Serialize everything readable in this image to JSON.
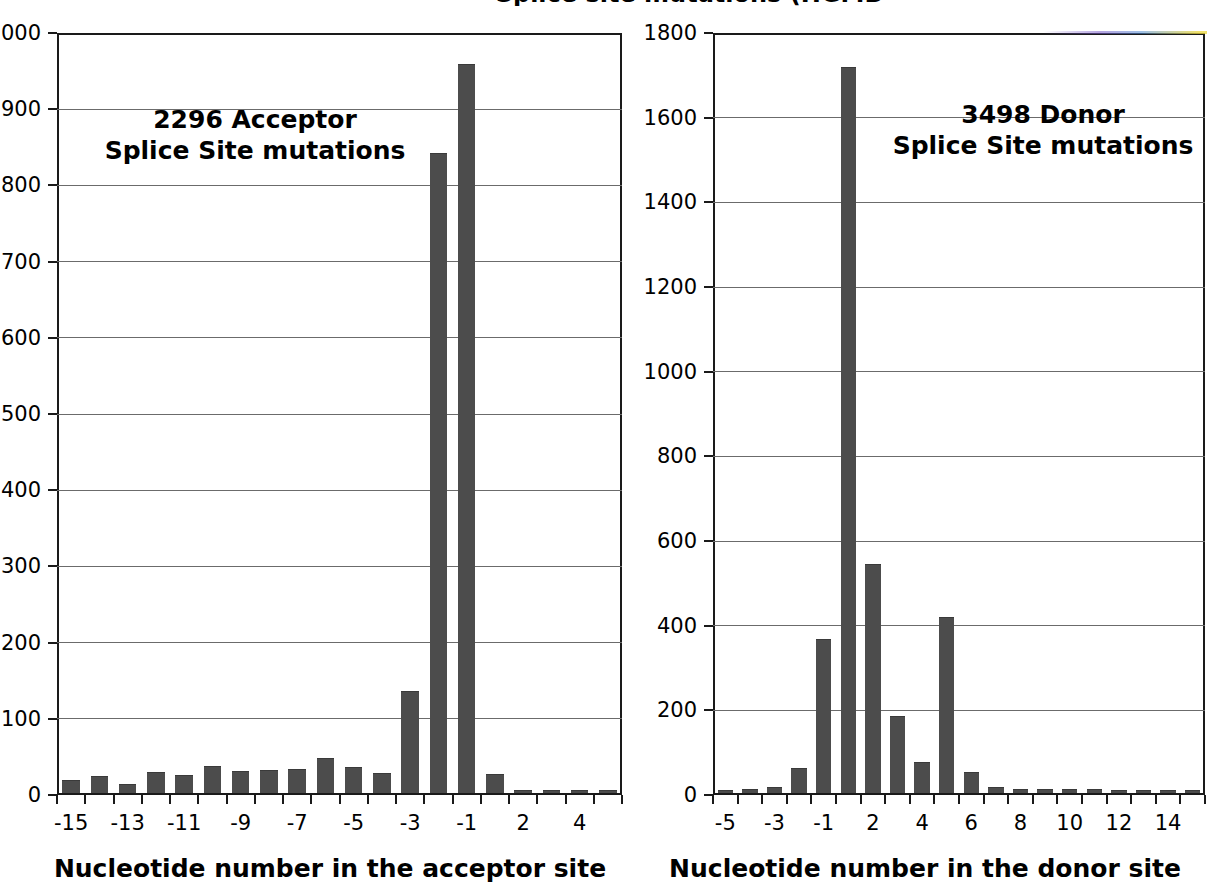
{
  "figure": {
    "background_color": "#ffffff",
    "bar_color": "#4c4c4c",
    "gridline_color": "#6b6b6b",
    "axis_color": "#1a1a1a",
    "cropped_top_title": "Splice site mutations (HGMD 2011.1)"
  },
  "chart_data": [
    {
      "id": "acceptor",
      "type": "bar",
      "title": "2296 Acceptor\nSplice Site mutations",
      "annotation": "2296 Acceptor\nSplice Site mutations",
      "xlabel": "Nucleotide number in the acceptor site",
      "ylabel": "",
      "ylim": [
        0,
        1000
      ],
      "ytick_step": 100,
      "yticks": [
        0,
        100,
        200,
        300,
        400,
        500,
        600,
        700,
        800,
        900,
        1000
      ],
      "ytick_labels": [
        "0",
        "100",
        "200",
        "300",
        "400",
        "500",
        "600",
        "700",
        "800",
        "900",
        "1000"
      ],
      "grid": true,
      "legend": "none",
      "categories": [
        "-15",
        "-14",
        "-13",
        "-12",
        "-11",
        "-10",
        "-9",
        "-8",
        "-7",
        "-6",
        "-5",
        "-4",
        "-3",
        "-2",
        "-1",
        "1",
        "2",
        "3",
        "4",
        "5"
      ],
      "visible_xtick_labels": [
        "-15",
        "",
        "-13",
        "",
        "-11",
        "",
        "-9",
        "",
        "-7",
        "",
        "-5",
        "",
        "-3",
        "",
        "-1",
        "",
        "2",
        "",
        "4",
        ""
      ],
      "values": [
        16,
        21,
        10,
        26,
        22,
        34,
        28,
        29,
        30,
        44,
        33,
        25,
        133,
        838,
        955,
        23,
        2,
        1,
        1,
        1
      ]
    },
    {
      "id": "donor",
      "type": "bar",
      "title": "3498 Donor\nSplice Site mutations",
      "annotation": "3498 Donor\nSplice Site mutations",
      "xlabel": "Nucleotide number in the donor site",
      "ylabel": "",
      "ylim": [
        0,
        1800
      ],
      "ytick_step": 200,
      "yticks": [
        0,
        200,
        400,
        600,
        800,
        1000,
        1200,
        1400,
        1600,
        1800
      ],
      "ytick_labels": [
        "0",
        "200",
        "400",
        "600",
        "800",
        "1000",
        "1200",
        "1400",
        "1600",
        "1800"
      ],
      "grid": true,
      "legend": "none",
      "categories": [
        "-5",
        "-4",
        "-3",
        "-2",
        "-1",
        "1",
        "2",
        "3",
        "4",
        "5",
        "6",
        "7",
        "8",
        "9",
        "10",
        "11",
        "12",
        "13",
        "14",
        "15"
      ],
      "visible_xtick_labels": [
        "-5",
        "",
        "-3",
        "",
        "-1",
        "",
        "2",
        "",
        "4",
        "",
        "6",
        "",
        "8",
        "",
        "10",
        "",
        "12",
        "",
        "14",
        ""
      ],
      "values": [
        2,
        6,
        12,
        56,
        362,
        1712,
        538,
        180,
        70,
        414,
        47,
        12,
        8,
        8,
        6,
        8,
        5,
        5,
        2,
        1
      ]
    }
  ]
}
